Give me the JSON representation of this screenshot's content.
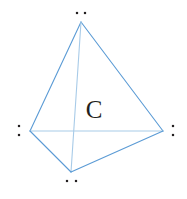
{
  "figure": {
    "center_atom": {
      "label": "C",
      "x": 94,
      "y": 118,
      "color": "#231f20"
    },
    "canvas": {
      "width": 187,
      "height": 199,
      "background": "#ffffff"
    }
  },
  "style": {
    "bond_color": "#5b9bd5",
    "bond_color_light": "#a8cbe8",
    "bond_width": 1.1,
    "dot_color": "#231f20",
    "dot_size": 2.2
  },
  "vertices": [
    {
      "name": "top",
      "x": 81,
      "y": 22,
      "lone_pair_layout": "horizontal",
      "dots": [
        {
          "x": 77,
          "y": 13
        },
        {
          "x": 85,
          "y": 13
        }
      ]
    },
    {
      "name": "left",
      "x": 30,
      "y": 131,
      "lone_pair_layout": "vertical",
      "dots": [
        {
          "x": 19,
          "y": 126
        },
        {
          "x": 19,
          "y": 135
        }
      ]
    },
    {
      "name": "right",
      "x": 163,
      "y": 131,
      "lone_pair_layout": "vertical",
      "dots": [
        {
          "x": 173,
          "y": 126
        },
        {
          "x": 173,
          "y": 135
        }
      ]
    },
    {
      "name": "bottom",
      "x": 71,
      "y": 172,
      "lone_pair_layout": "horizontal",
      "dots": [
        {
          "x": 67,
          "y": 181
        },
        {
          "x": 76,
          "y": 181
        }
      ]
    }
  ],
  "edges": [
    {
      "name": "top-left",
      "from": "top",
      "to": "left",
      "shade": "normal"
    },
    {
      "name": "top-right",
      "from": "top",
      "to": "right",
      "shade": "normal"
    },
    {
      "name": "top-bottom",
      "from": "top",
      "to": "bottom",
      "shade": "light"
    },
    {
      "name": "left-right",
      "from": "left",
      "to": "right",
      "shade": "light"
    },
    {
      "name": "left-bottom",
      "from": "left",
      "to": "bottom",
      "shade": "normal"
    },
    {
      "name": "right-bottom",
      "from": "right",
      "to": "bottom",
      "shade": "normal"
    }
  ]
}
